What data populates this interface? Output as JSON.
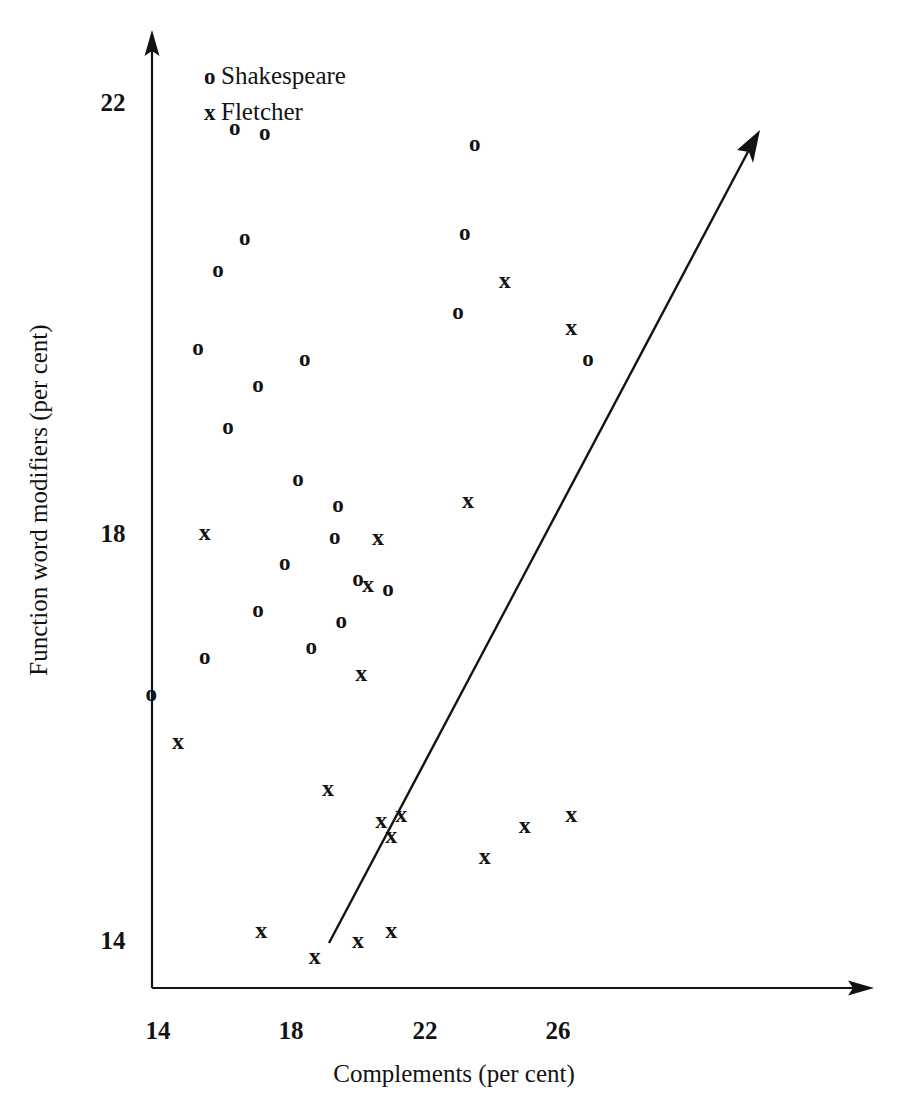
{
  "chart_data": {
    "type": "scatter",
    "title": "",
    "xlabel": "Complements (per cent)",
    "ylabel": "Function word modifiers (per cent)",
    "xlim": [
      12.6,
      27.9
    ],
    "ylim": [
      13.2,
      22.7
    ],
    "xticks": [
      14,
      18,
      22,
      26
    ],
    "yticks": [
      14,
      18,
      22
    ],
    "xtick_labels": [
      "14",
      "18",
      "22",
      "26"
    ],
    "ytick_labels": [
      "14",
      "18",
      "22"
    ],
    "grid": false,
    "legend_position": "upper-left-inside",
    "legend": [
      {
        "marker": "o",
        "label": "Shakespeare"
      },
      {
        "marker": "x",
        "label": "Fletcher"
      }
    ],
    "annotations": [
      {
        "name": "trend-arrow",
        "type": "arrow",
        "x_start": 19.1,
        "y_start": 13.95,
        "x_end": 30.0,
        "y_end": 21.7
      }
    ],
    "series": [
      {
        "name": "Shakespeare",
        "marker": "o",
        "points": [
          {
            "x": 16.3,
            "y": 21.75
          },
          {
            "x": 17.2,
            "y": 21.7
          },
          {
            "x": 23.5,
            "y": 21.6
          },
          {
            "x": 23.2,
            "y": 20.75
          },
          {
            "x": 16.6,
            "y": 20.7
          },
          {
            "x": 15.8,
            "y": 20.4
          },
          {
            "x": 23.0,
            "y": 20.0
          },
          {
            "x": 15.2,
            "y": 19.65
          },
          {
            "x": 26.9,
            "y": 19.55
          },
          {
            "x": 18.4,
            "y": 19.55
          },
          {
            "x": 17.0,
            "y": 19.3
          },
          {
            "x": 16.1,
            "y": 18.9
          },
          {
            "x": 18.2,
            "y": 18.4
          },
          {
            "x": 19.4,
            "y": 18.15
          },
          {
            "x": 19.3,
            "y": 17.85
          },
          {
            "x": 17.8,
            "y": 17.6
          },
          {
            "x": 20.0,
            "y": 17.45
          },
          {
            "x": 20.9,
            "y": 17.35
          },
          {
            "x": 17.0,
            "y": 17.15
          },
          {
            "x": 19.5,
            "y": 17.05
          },
          {
            "x": 18.6,
            "y": 16.8
          },
          {
            "x": 15.4,
            "y": 16.7
          },
          {
            "x": 13.8,
            "y": 16.35
          }
        ]
      },
      {
        "name": "Fletcher",
        "marker": "x",
        "points": [
          {
            "x": 24.4,
            "y": 20.3
          },
          {
            "x": 26.4,
            "y": 19.85
          },
          {
            "x": 23.3,
            "y": 18.2
          },
          {
            "x": 15.4,
            "y": 17.9
          },
          {
            "x": 20.6,
            "y": 17.85
          },
          {
            "x": 20.3,
            "y": 17.4
          },
          {
            "x": 20.1,
            "y": 16.55
          },
          {
            "x": 14.6,
            "y": 15.9
          },
          {
            "x": 19.1,
            "y": 15.45
          },
          {
            "x": 20.7,
            "y": 15.15
          },
          {
            "x": 21.3,
            "y": 15.2
          },
          {
            "x": 25.0,
            "y": 15.1
          },
          {
            "x": 26.4,
            "y": 15.2
          },
          {
            "x": 21.0,
            "y": 15.0
          },
          {
            "x": 23.8,
            "y": 14.8
          },
          {
            "x": 17.1,
            "y": 14.1
          },
          {
            "x": 20.0,
            "y": 14.0
          },
          {
            "x": 21.0,
            "y": 14.1
          },
          {
            "x": 18.7,
            "y": 13.85
          }
        ]
      }
    ]
  },
  "axes": {
    "x_title": "Complements (per cent)",
    "y_title": "Function word modifiers (per cent)",
    "x_tick_labels": [
      "14",
      "18",
      "22",
      "26"
    ],
    "y_tick_labels": [
      "22",
      "18",
      "14"
    ]
  },
  "legend": {
    "shakespeare_marker": "o",
    "shakespeare_label": "Shakespeare",
    "fletcher_marker": "x",
    "fletcher_label": "Fletcher"
  },
  "colors": {
    "ink": "#131313",
    "background": "#ffffff"
  }
}
